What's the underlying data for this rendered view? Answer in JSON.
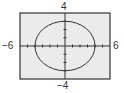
{
  "chart_data": {
    "type": "line",
    "title": "",
    "xlabel": "",
    "ylabel": "",
    "xlim": [
      -6,
      6
    ],
    "ylim": [
      -4,
      4
    ],
    "grid": false,
    "x_ticks": [
      -5,
      -4,
      -3,
      -2,
      -1,
      1,
      2,
      3,
      4,
      5
    ],
    "y_ticks": [
      -3,
      -2,
      -1,
      1,
      2,
      3
    ],
    "tick_labels": {
      "x_min": "−6",
      "x_max": "6",
      "y_min": "−4",
      "y_max": "4"
    },
    "series": [
      {
        "name": "ellipse",
        "equation": "x^2/16 + y^2/9 = 1",
        "center": [
          0,
          0
        ],
        "semi_axis_x": 4,
        "semi_axis_y": 3,
        "color": "#333333"
      }
    ],
    "colors": {
      "plot_background": "#ebebeb",
      "frame": "#333333",
      "axes": "#333333",
      "page_background": "#ffffff"
    }
  }
}
